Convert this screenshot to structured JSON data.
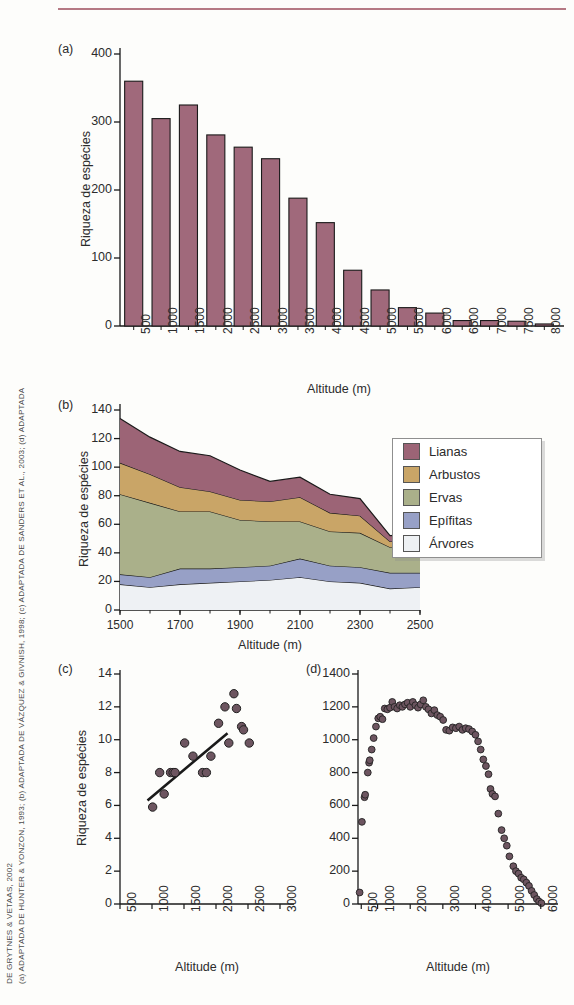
{
  "figure": {
    "credit_line_1": "(a) ADAPTADA DE HUNTER & YONZON, 1993; (b) ADAPTADA DE VÁZQUEZ & GIVNISH, 1998; (c) ADAPTADA DE SANDERS ET AL., 2003; (d) ADAPTADA",
    "credit_line_2": "DE GRYTNES & VETAAS, 2002"
  },
  "colors": {
    "lianas": "#9c6476",
    "arbustos": "#c9a567",
    "ervas": "#aab08a",
    "epifitas": "#97a0c6",
    "arvores": "#eef1f4",
    "bar": "#a0697b",
    "outline": "#1a1a1a",
    "rule": "#a8616f"
  },
  "legend": {
    "items": [
      {
        "label": "Lianas",
        "color_key": "lianas"
      },
      {
        "label": "Arbustos",
        "color_key": "arbustos"
      },
      {
        "label": "Ervas",
        "color_key": "ervas"
      },
      {
        "label": "Epífitas",
        "color_key": "epifitas"
      },
      {
        "label": "Árvores",
        "color_key": "arvores"
      }
    ]
  },
  "chart_data": [
    {
      "panel": "a",
      "type": "bar",
      "title": "",
      "xlabel": "Altitude (m)",
      "ylabel": "Riqueza de espécies",
      "ylim": [
        0,
        400
      ],
      "yticks": [
        0,
        100,
        200,
        300,
        400
      ],
      "categories": [
        "500",
        "1000",
        "1500",
        "2000",
        "2500",
        "3000",
        "3500",
        "4000",
        "4500",
        "5000",
        "5500",
        "6000",
        "6500",
        "7000",
        "7500",
        "8000"
      ],
      "values": [
        360,
        305,
        325,
        281,
        263,
        246,
        188,
        152,
        82,
        53,
        27,
        19,
        8,
        8,
        7,
        3
      ],
      "grid": false,
      "legend": "none"
    },
    {
      "panel": "b",
      "type": "area",
      "title": "",
      "xlabel": "Altitude (m)",
      "ylabel": "Riqueza de espécies",
      "ylim": [
        0,
        140
      ],
      "yticks": [
        0,
        20,
        40,
        60,
        80,
        100,
        120,
        140
      ],
      "xlim": [
        1500,
        2500
      ],
      "xticks": [
        "1500",
        "1700",
        "1900",
        "2100",
        "2300",
        "2500"
      ],
      "x": [
        1500,
        1600,
        1700,
        1800,
        1900,
        2000,
        2100,
        2200,
        2300,
        2400,
        2500
      ],
      "stacked": true,
      "series": [
        {
          "name": "Árvores",
          "values": [
            18,
            16,
            18,
            19,
            20,
            21,
            23,
            20,
            19,
            15,
            16
          ]
        },
        {
          "name": "Epífitas",
          "values": [
            7,
            7,
            11,
            10,
            10,
            10,
            13,
            11,
            11,
            11,
            10
          ]
        },
        {
          "name": "Ervas",
          "values": [
            56,
            52,
            40,
            40,
            33,
            31,
            26,
            24,
            24,
            18,
            19
          ]
        },
        {
          "name": "Arbustos",
          "values": [
            22,
            20,
            17,
            14,
            14,
            14,
            17,
            13,
            12,
            4,
            4
          ]
        },
        {
          "name": "Lianas",
          "values": [
            31,
            26,
            25,
            25,
            21,
            14,
            14,
            13,
            12,
            4,
            4
          ]
        }
      ],
      "grid": false,
      "legend": "right"
    },
    {
      "panel": "c",
      "type": "scatter",
      "title": "",
      "xlabel": "Altitude (m)",
      "ylabel": "Riqueza de espécies",
      "ylim": [
        0,
        14
      ],
      "yticks": [
        0,
        2,
        4,
        6,
        8,
        10,
        12,
        14
      ],
      "xlim": [
        500,
        3000
      ],
      "xticks": [
        "500",
        "1000",
        "1500",
        "2000",
        "2500",
        "3000"
      ],
      "points": [
        {
          "x": 1010,
          "y": 5.9
        },
        {
          "x": 1120,
          "y": 8.0
        },
        {
          "x": 1190,
          "y": 6.7
        },
        {
          "x": 1290,
          "y": 8.0
        },
        {
          "x": 1330,
          "y": 8.0
        },
        {
          "x": 1360,
          "y": 8.0
        },
        {
          "x": 1510,
          "y": 9.8
        },
        {
          "x": 1640,
          "y": 9.0
        },
        {
          "x": 1790,
          "y": 8.0
        },
        {
          "x": 1850,
          "y": 8.0
        },
        {
          "x": 1920,
          "y": 9.0
        },
        {
          "x": 2040,
          "y": 11.0
        },
        {
          "x": 2140,
          "y": 12.0
        },
        {
          "x": 2200,
          "y": 9.8
        },
        {
          "x": 2280,
          "y": 12.8
        },
        {
          "x": 2320,
          "y": 11.9
        },
        {
          "x": 2400,
          "y": 10.8
        },
        {
          "x": 2430,
          "y": 10.6
        },
        {
          "x": 2520,
          "y": 9.8
        }
      ],
      "trendline": {
        "x0": 930,
        "y0": 6.3,
        "x1": 2180,
        "y1": 10.4
      },
      "grid": false,
      "legend": "none"
    },
    {
      "panel": "d",
      "type": "scatter",
      "title": "",
      "xlabel": "Altitude (m)",
      "ylabel": "",
      "ylim": [
        0,
        1400
      ],
      "yticks": [
        0,
        200,
        400,
        600,
        800,
        1000,
        1200,
        1400
      ],
      "xlim": [
        400,
        6100
      ],
      "xticks": [
        "500",
        "1000",
        "2000",
        "3000",
        "4000",
        "5000",
        "6000"
      ],
      "points": [
        {
          "x": 450,
          "y": 70
        },
        {
          "x": 520,
          "y": 500
        },
        {
          "x": 600,
          "y": 650
        },
        {
          "x": 620,
          "y": 665
        },
        {
          "x": 700,
          "y": 800
        },
        {
          "x": 740,
          "y": 860
        },
        {
          "x": 760,
          "y": 875
        },
        {
          "x": 820,
          "y": 940
        },
        {
          "x": 880,
          "y": 1010
        },
        {
          "x": 950,
          "y": 1080
        },
        {
          "x": 1020,
          "y": 1130
        },
        {
          "x": 1080,
          "y": 1140
        },
        {
          "x": 1150,
          "y": 1125
        },
        {
          "x": 1220,
          "y": 1190
        },
        {
          "x": 1300,
          "y": 1185
        },
        {
          "x": 1380,
          "y": 1195
        },
        {
          "x": 1450,
          "y": 1230
        },
        {
          "x": 1520,
          "y": 1200
        },
        {
          "x": 1600,
          "y": 1190
        },
        {
          "x": 1680,
          "y": 1210
        },
        {
          "x": 1760,
          "y": 1200
        },
        {
          "x": 1840,
          "y": 1215
        },
        {
          "x": 1920,
          "y": 1225
        },
        {
          "x": 2000,
          "y": 1200
        },
        {
          "x": 2080,
          "y": 1230
        },
        {
          "x": 2160,
          "y": 1210
        },
        {
          "x": 2240,
          "y": 1195
        },
        {
          "x": 2320,
          "y": 1215
        },
        {
          "x": 2400,
          "y": 1240
        },
        {
          "x": 2480,
          "y": 1200
        },
        {
          "x": 2560,
          "y": 1185
        },
        {
          "x": 2650,
          "y": 1160
        },
        {
          "x": 2740,
          "y": 1180
        },
        {
          "x": 2830,
          "y": 1150
        },
        {
          "x": 2920,
          "y": 1140
        },
        {
          "x": 3010,
          "y": 1120
        },
        {
          "x": 3100,
          "y": 1060
        },
        {
          "x": 3200,
          "y": 1055
        },
        {
          "x": 3300,
          "y": 1075
        },
        {
          "x": 3400,
          "y": 1070
        },
        {
          "x": 3500,
          "y": 1080
        },
        {
          "x": 3600,
          "y": 1060
        },
        {
          "x": 3700,
          "y": 1070
        },
        {
          "x": 3800,
          "y": 1065
        },
        {
          "x": 3900,
          "y": 1050
        },
        {
          "x": 4000,
          "y": 1030
        },
        {
          "x": 4080,
          "y": 990
        },
        {
          "x": 4160,
          "y": 940
        },
        {
          "x": 4240,
          "y": 880
        },
        {
          "x": 4320,
          "y": 840
        },
        {
          "x": 4400,
          "y": 790
        },
        {
          "x": 4460,
          "y": 700
        },
        {
          "x": 4520,
          "y": 670
        },
        {
          "x": 4600,
          "y": 655
        },
        {
          "x": 4700,
          "y": 550
        },
        {
          "x": 4800,
          "y": 450
        },
        {
          "x": 4880,
          "y": 400
        },
        {
          "x": 4960,
          "y": 355
        },
        {
          "x": 5040,
          "y": 290
        },
        {
          "x": 5160,
          "y": 230
        },
        {
          "x": 5240,
          "y": 200
        },
        {
          "x": 5320,
          "y": 185
        },
        {
          "x": 5400,
          "y": 160
        },
        {
          "x": 5480,
          "y": 150
        },
        {
          "x": 5560,
          "y": 130
        },
        {
          "x": 5640,
          "y": 110
        },
        {
          "x": 5720,
          "y": 80
        },
        {
          "x": 5800,
          "y": 55
        },
        {
          "x": 5880,
          "y": 30
        },
        {
          "x": 5950,
          "y": 15
        },
        {
          "x": 6020,
          "y": 5
        }
      ],
      "grid": false,
      "legend": "none"
    }
  ],
  "panels": {
    "a": {
      "label": "(a)"
    },
    "b": {
      "label": "(b)"
    },
    "c": {
      "label": "(c)"
    },
    "d": {
      "label": "(d)"
    }
  }
}
